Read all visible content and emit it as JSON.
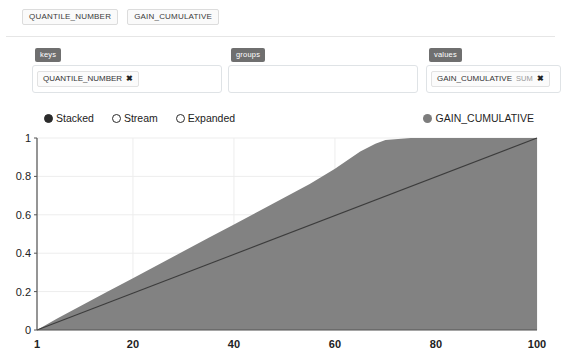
{
  "field_strip": {
    "chips": [
      "QUANTILE_NUMBER",
      "GAIN_CUMULATIVE"
    ]
  },
  "dropzones": [
    {
      "id": "keys",
      "label": "keys",
      "chips": [
        {
          "field": "GAIN_PLACEHOLDER",
          "name": "QUANTILE_NUMBER",
          "agg": "",
          "remove": "✖"
        }
      ]
    },
    {
      "id": "groups",
      "label": "groups",
      "chips": []
    },
    {
      "id": "values",
      "label": "values",
      "chips": [
        {
          "name": "GAIN_CUMULATIVE",
          "agg": "SUM",
          "remove": "✖"
        }
      ]
    }
  ],
  "dropzone_labels": {
    "keys": "keys",
    "groups": "groups",
    "values": "values"
  },
  "chips": {
    "keys_name": "QUANTILE_NUMBER",
    "keys_remove": "✖",
    "values_name": "GAIN_CUMULATIVE",
    "values_agg": "SUM",
    "values_remove": "✖"
  },
  "legend": {
    "modes": [
      {
        "label": "Stacked",
        "selected": true
      },
      {
        "label": "Stream",
        "selected": false
      },
      {
        "label": "Expanded",
        "selected": false
      }
    ],
    "mode_stacked": "Stacked",
    "mode_stream": "Stream",
    "mode_expanded": "Expanded",
    "series_label": "GAIN_CUMULATIVE",
    "series_color": "#7d7d7d"
  },
  "colors": {
    "area_fill": "#828282",
    "reference_line": "#3c3c3c",
    "axis": "#555555",
    "grid": "#ededed",
    "zone_label_bg": "#6f6f6f"
  },
  "chart_data": {
    "type": "area",
    "title": "",
    "xlabel": "",
    "ylabel": "",
    "xlim": [
      1,
      100
    ],
    "ylim": [
      0,
      1
    ],
    "grid": true,
    "legend_position": "top-right",
    "xticks": [
      1,
      20,
      40,
      60,
      80,
      100
    ],
    "yticks": [
      0,
      0.2,
      0.4,
      0.6,
      0.8,
      1
    ],
    "ytick_labels": [
      "0",
      "0.2",
      "0.4",
      "0.6",
      "0.8",
      "1"
    ],
    "xtick_labels": [
      "1",
      "20",
      "40",
      "60",
      "80",
      "100"
    ],
    "series": [
      {
        "name": "GAIN_CUMULATIVE",
        "type": "area",
        "color": "#828282",
        "x": [
          1,
          5,
          10,
          15,
          20,
          25,
          30,
          35,
          40,
          45,
          50,
          55,
          60,
          65,
          68,
          70,
          75,
          80,
          85,
          90,
          95,
          100
        ],
        "values": [
          0.0,
          0.06,
          0.13,
          0.2,
          0.27,
          0.34,
          0.41,
          0.48,
          0.55,
          0.62,
          0.69,
          0.76,
          0.84,
          0.93,
          0.97,
          0.99,
          1.0,
          1.0,
          1.0,
          1.0,
          1.0,
          1.0
        ]
      },
      {
        "name": "baseline",
        "type": "line",
        "color": "#3c3c3c",
        "x": [
          1,
          100
        ],
        "values": [
          0.0,
          1.0
        ]
      }
    ]
  }
}
